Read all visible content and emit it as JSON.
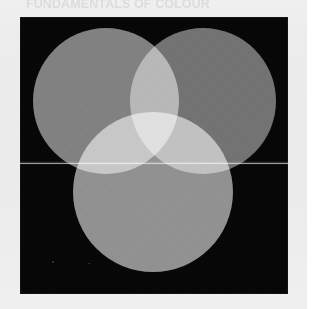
{
  "page": {
    "media": "scanned-book-page",
    "background_color": "#f4f4f4",
    "bleed_through_caption_top": "FUNDAMENTALS OF COLOUR",
    "bleed_through_caption_bottom": ""
  },
  "plate": {
    "name": "additive-colour-mixing-plate",
    "background_color": "#070707",
    "blend_mode": "additive (screen)",
    "artifact_label": "scanner seam line",
    "discs": [
      {
        "id": "red-light",
        "role": "additive primary 1 (top-left)",
        "rendered_gray": "#7d7d7d",
        "center_x": 86,
        "center_y": 84,
        "radius": 73
      },
      {
        "id": "green-light",
        "role": "additive primary 2 (top-right)",
        "rendered_gray": "#6f6f6f",
        "center_x": 183,
        "center_y": 84,
        "radius": 73
      },
      {
        "id": "blue-light",
        "role": "additive primary 3 (bottom-centre)",
        "rendered_gray": "#8e8e8e",
        "center_x": 133,
        "center_y": 175,
        "radius": 80
      }
    ],
    "overlaps": [
      {
        "id": "top-lens",
        "of": "primary 1 + primary 2",
        "rendered_gray": "#b9b9b9"
      },
      {
        "id": "left-lens",
        "of": "primary 1 + primary 3",
        "rendered_gray": "#c9c9c9"
      },
      {
        "id": "right-lens",
        "of": "primary 2 + primary 3",
        "rendered_gray": "#bdbdbd"
      },
      {
        "id": "centre",
        "of": "all three primaries",
        "rendered_gray": "#f6f6f6"
      }
    ]
  },
  "chart_data": {
    "type": "diagram",
    "subtitle": "grayscale halftone reproduction on black ground",
    "categories": [
      "primary 1 (top-left)",
      "primary 2 (top-right)",
      "primary 3 (bottom)"
    ],
    "values": [
      49,
      44,
      56
    ],
    "ylabel": "relative luminance (0-100)",
    "xlabel": "",
    "ylim": [
      0,
      100
    ],
    "annotations": [
      "pairwise overlaps brighten to ~73-79",
      "triple overlap saturates to ~96 (near white)",
      "ground outside all discs reads ~3 (near black)"
    ],
    "legend_position": "none",
    "grid": false
  }
}
